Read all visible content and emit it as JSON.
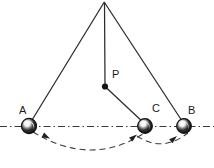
{
  "figure": {
    "canvas": {
      "width": 214,
      "height": 168,
      "background": "#ffffff"
    },
    "colors": {
      "stroke": "#2b2b2b",
      "dashed": "#3a3a3a",
      "ball_fill": "#1a1a1a",
      "ball_highlight": "#ffffff",
      "label": "#1a1a1a"
    },
    "labels": {
      "a": "A",
      "b": "B",
      "c": "C",
      "p": "P"
    },
    "points": {
      "apex": {
        "x": 104,
        "y": 2,
        "name": "pivot"
      },
      "p": {
        "x": 105,
        "y": 86,
        "name": "bob-P"
      },
      "a": {
        "x": 29,
        "y": 126,
        "name": "ball-A"
      },
      "c": {
        "x": 145,
        "y": 126,
        "name": "ball-C"
      },
      "b": {
        "x": 184,
        "y": 126,
        "name": "ball-B"
      }
    },
    "label_positions": {
      "a": {
        "x": 20,
        "y": 106
      },
      "c": {
        "x": 152,
        "y": 104
      },
      "b": {
        "x": 188,
        "y": 106
      },
      "p": {
        "x": 112,
        "y": 70
      }
    },
    "ball_radius": 7.5,
    "baseline": {
      "y": 126,
      "x1": 0,
      "x2": 214,
      "style": "dash-dot"
    },
    "strings": [
      {
        "name": "string-apex-to-A",
        "from": "apex",
        "to": "a"
      },
      {
        "name": "string-apex-to-P",
        "from": "apex",
        "to": "p"
      },
      {
        "name": "string-apex-to-B",
        "from": "apex",
        "to": "b"
      },
      {
        "name": "string-P-to-C",
        "from": "p",
        "to": "c"
      }
    ],
    "arcs": [
      {
        "name": "swing-arc-A-to-C",
        "path": "M 33 131 Q 90 166 143 133",
        "style": "dashed",
        "arrows": 2
      },
      {
        "name": "swing-arc-C-to-B",
        "path": "M 139 134 Q 163 152 188 133",
        "style": "dashed",
        "arrows": 1
      }
    ],
    "arrowheads": [
      {
        "name": "arrowhead-near-A",
        "x": 48,
        "y": 137,
        "angle": 28
      },
      {
        "name": "arrowhead-near-C",
        "x": 136,
        "y": 139,
        "angle": -36
      },
      {
        "name": "arrowhead-right-arc",
        "x": 176,
        "y": 139,
        "angle": -42
      }
    ]
  }
}
